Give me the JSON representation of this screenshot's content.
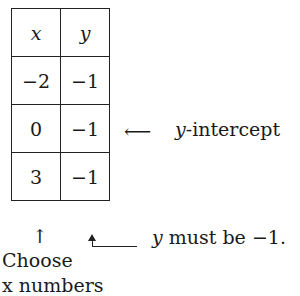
{
  "table": {
    "headers": [
      "x",
      "y"
    ],
    "rows": [
      [
        "−2",
        "−1"
      ],
      [
        "0",
        "−1"
      ],
      [
        "3",
        "−1"
      ]
    ]
  },
  "annotations": {
    "intercept_arrow": "⟵",
    "intercept_var": "y",
    "intercept_text": "-intercept",
    "up_arrow": "↑",
    "y_note_var": "y",
    "y_note_text": " must be −1.",
    "choose_line1": "Choose",
    "choose_line2": "x numbers"
  }
}
